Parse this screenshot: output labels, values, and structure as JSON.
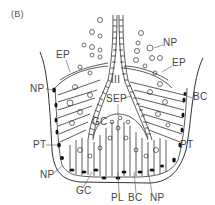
{
  "figure": {
    "panel_label": "(B)",
    "labels": {
      "ep_left": "EP",
      "np_top_right": "NP",
      "ep_right": "EP",
      "np_left_upper": "NP",
      "bc_right": "BC",
      "iii": "III",
      "sep": "SEP",
      "gc_inner": "GC",
      "pt_left": "PT",
      "pt_right": "PT",
      "np_left_lower": "NP",
      "gc_bottom": "GC",
      "pl_bottom": "PL",
      "bc_bottom": "BC",
      "np_bottom": "NP"
    },
    "colors": {
      "line": "#333333",
      "text": "#444444",
      "background": "#ffffff"
    }
  }
}
